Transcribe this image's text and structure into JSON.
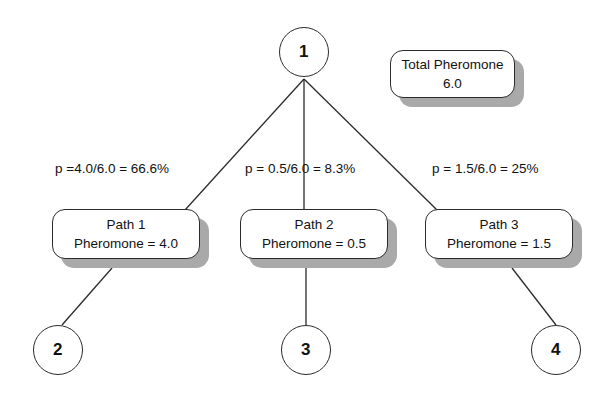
{
  "diagram": {
    "background_color": "#ffffff",
    "line_color": "#2b2b2b",
    "shadow_color": "#a9a9a9",
    "text_color": "#121212"
  },
  "root_node": {
    "label": "1"
  },
  "total_pheromone_box": {
    "line1": "Total Pheromone",
    "line2": "6.0"
  },
  "probability_labels": [
    {
      "text": "p =4.0/6.0 = 66.6%"
    },
    {
      "text": "p = 0.5/6.0 = 8.3%"
    },
    {
      "text": "p = 1.5/6.0 = 25%"
    }
  ],
  "path_boxes": [
    {
      "line1": "Path 1",
      "line2": "Pheromone = 4.0"
    },
    {
      "line1": "Path 2",
      "line2": "Pheromone = 0.5"
    },
    {
      "line1": "Path 3",
      "line2": "Pheromone = 1.5"
    }
  ],
  "leaf_nodes": [
    {
      "label": "2"
    },
    {
      "label": "3"
    },
    {
      "label": "4"
    }
  ]
}
